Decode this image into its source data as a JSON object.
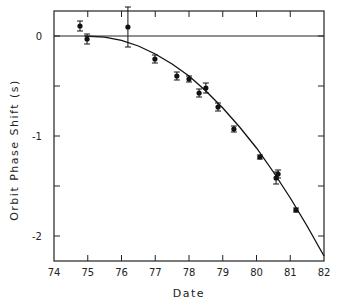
{
  "chart_data": {
    "type": "scatter",
    "title": "",
    "xlabel": "Date",
    "ylabel": "Orbit Phase Shift (s)",
    "xlim": [
      74,
      82
    ],
    "ylim": [
      -2.25,
      0.25
    ],
    "x_ticks": [
      74,
      75,
      76,
      77,
      78,
      79,
      80,
      81,
      82
    ],
    "x_tick_labels": [
      "74",
      "75",
      "76",
      "77",
      "78",
      "79",
      "80",
      "81",
      "82"
    ],
    "y_ticks": [
      0,
      -0.5,
      -1,
      -1.5,
      -2
    ],
    "y_tick_labels": [
      "0",
      "",
      "-1",
      "",
      "-2"
    ],
    "grid": false,
    "legend": null,
    "series": [
      {
        "name": "Measured",
        "kind": "points_with_error_bars",
        "points": [
          {
            "x": 74.77,
            "y": 0.1,
            "err": 0.05
          },
          {
            "x": 74.98,
            "y": -0.03,
            "err": 0.05
          },
          {
            "x": 76.19,
            "y": 0.09,
            "err": 0.2
          },
          {
            "x": 76.99,
            "y": -0.23,
            "err": 0.04
          },
          {
            "x": 77.64,
            "y": -0.4,
            "err": 0.04
          },
          {
            "x": 78.0,
            "y": -0.43,
            "err": 0.03
          },
          {
            "x": 78.3,
            "y": -0.57,
            "err": 0.04
          },
          {
            "x": 78.5,
            "y": -0.52,
            "err": 0.05
          },
          {
            "x": 78.86,
            "y": -0.71,
            "err": 0.04
          },
          {
            "x": 79.33,
            "y": -0.93,
            "err": 0.03
          },
          {
            "x": 80.1,
            "y": -1.21,
            "err": 0.02
          },
          {
            "x": 80.58,
            "y": -1.42,
            "err": 0.06
          },
          {
            "x": 80.64,
            "y": -1.38,
            "err": 0.04
          },
          {
            "x": 81.17,
            "y": -1.74,
            "err": 0.02
          }
        ]
      },
      {
        "name": "General relativity prediction",
        "kind": "curve",
        "x": [
          74.9,
          75.5,
          76,
          76.5,
          77,
          77.5,
          78,
          78.5,
          79,
          79.5,
          80,
          80.5,
          81,
          81.5,
          82
        ],
        "y": [
          0,
          -0.011,
          -0.044,
          -0.1,
          -0.18,
          -0.28,
          -0.4,
          -0.55,
          -0.72,
          -0.91,
          -1.12,
          -1.36,
          -1.62,
          -1.9,
          -2.2
        ]
      },
      {
        "name": "Zero line",
        "kind": "hline",
        "y": 0
      }
    ]
  }
}
